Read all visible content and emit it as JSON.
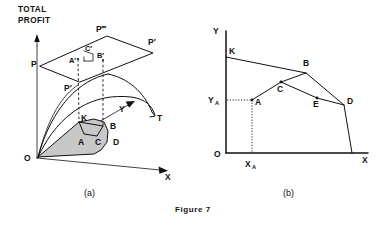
{
  "figure": {
    "caption": "Figure 7",
    "panels": [
      {
        "id": "a",
        "label": "(a)"
      },
      {
        "id": "b",
        "label": "(b)"
      }
    ]
  },
  "panel_a": {
    "vertical_axis_label_line1": "TOTAL",
    "vertical_axis_label_line2": "PROFIT",
    "axis_x_label": "X",
    "axis_y_label": "Y",
    "origin_label": "O",
    "surface_labels": {
      "p_left": "P",
      "p_top": "P‴",
      "p_right": "P′",
      "p_lower": "P′",
      "t": "T"
    },
    "plane_points": {
      "a_prime": "A′",
      "b_prime": "B′",
      "c_prime": "C′"
    },
    "base_points": {
      "k": "K",
      "a": "A",
      "b": "B",
      "c": "C",
      "d": "D"
    },
    "shaded_region_color": "#c8c8c8"
  },
  "panel_b": {
    "axis_y_label": "Y",
    "axis_x_label": "X",
    "origin_label": "O",
    "tick_y_label": "Y",
    "tick_y_sub": "A",
    "tick_x_label": "X",
    "tick_x_sub": "A",
    "points": {
      "k": "K",
      "a": "A",
      "b": "B",
      "c": "C",
      "d": "D",
      "e": "E"
    }
  },
  "colors": {
    "ink": "#111111",
    "paper": "#ffffff",
    "shade": "#c8c8c8"
  }
}
